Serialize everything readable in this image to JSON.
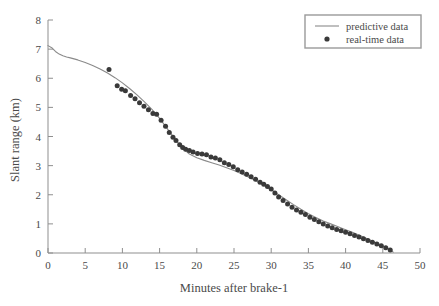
{
  "chart_data": {
    "type": "line",
    "title": "",
    "xlabel": "Minutes after brake-1",
    "ylabel": "Slant range (km)",
    "xlim": [
      0,
      50
    ],
    "ylim": [
      0,
      8
    ],
    "xticks": [
      0,
      5,
      10,
      15,
      20,
      25,
      30,
      35,
      40,
      45,
      50
    ],
    "yticks": [
      0,
      1,
      2,
      3,
      4,
      5,
      6,
      7,
      8
    ],
    "grid": false,
    "legend_position": "top-right",
    "legend": [
      {
        "label": "predictive data",
        "marker": "line",
        "color": "#8a8a8a"
      },
      {
        "label": "real-time data",
        "marker": "dot",
        "color": "#3a3a3a"
      }
    ],
    "series": [
      {
        "name": "predictive data",
        "type": "line",
        "color": "#8a8a8a",
        "points": [
          [
            0.0,
            7.12
          ],
          [
            0.5,
            7.05
          ],
          [
            1.0,
            6.92
          ],
          [
            1.5,
            6.83
          ],
          [
            2.0,
            6.77
          ],
          [
            2.5,
            6.73
          ],
          [
            3.0,
            6.7
          ],
          [
            4.0,
            6.63
          ],
          [
            5.0,
            6.54
          ],
          [
            6.0,
            6.44
          ],
          [
            7.0,
            6.32
          ],
          [
            8.0,
            6.18
          ],
          [
            9.0,
            6.02
          ],
          [
            10.0,
            5.84
          ],
          [
            11.0,
            5.64
          ],
          [
            12.0,
            5.42
          ],
          [
            13.0,
            5.18
          ],
          [
            14.0,
            4.92
          ],
          [
            15.0,
            4.62
          ],
          [
            16.0,
            4.28
          ],
          [
            17.0,
            3.94
          ],
          [
            18.0,
            3.62
          ],
          [
            19.0,
            3.4
          ],
          [
            20.0,
            3.27
          ],
          [
            21.0,
            3.18
          ],
          [
            22.0,
            3.1
          ],
          [
            23.0,
            3.02
          ],
          [
            24.0,
            2.93
          ],
          [
            25.0,
            2.83
          ],
          [
            26.0,
            2.72
          ],
          [
            27.0,
            2.6
          ],
          [
            28.0,
            2.47
          ],
          [
            29.0,
            2.33
          ],
          [
            30.0,
            2.17
          ],
          [
            31.0,
            2.0
          ],
          [
            32.0,
            1.83
          ],
          [
            33.0,
            1.66
          ],
          [
            34.0,
            1.5
          ],
          [
            35.0,
            1.35
          ],
          [
            36.0,
            1.22
          ],
          [
            37.0,
            1.1
          ],
          [
            38.0,
            1.0
          ],
          [
            39.0,
            0.9
          ],
          [
            40.0,
            0.8
          ],
          [
            41.0,
            0.7
          ],
          [
            42.0,
            0.59
          ],
          [
            43.0,
            0.48
          ],
          [
            44.0,
            0.36
          ],
          [
            45.0,
            0.24
          ],
          [
            46.0,
            0.11
          ],
          [
            46.4,
            0.03
          ]
        ]
      },
      {
        "name": "real-time data",
        "type": "scatter",
        "color": "#3a3a3a",
        "points": [
          [
            8.2,
            6.3
          ],
          [
            9.3,
            5.74
          ],
          [
            9.9,
            5.62
          ],
          [
            10.4,
            5.57
          ],
          [
            11.1,
            5.41
          ],
          [
            11.7,
            5.3
          ],
          [
            12.3,
            5.16
          ],
          [
            12.9,
            5.04
          ],
          [
            13.5,
            4.92
          ],
          [
            14.1,
            4.79
          ],
          [
            14.6,
            4.76
          ],
          [
            15.2,
            4.56
          ],
          [
            15.8,
            4.35
          ],
          [
            16.3,
            4.14
          ],
          [
            16.8,
            3.97
          ],
          [
            17.2,
            3.86
          ],
          [
            17.7,
            3.72
          ],
          [
            18.1,
            3.62
          ],
          [
            18.5,
            3.56
          ],
          [
            19.0,
            3.52
          ],
          [
            19.5,
            3.47
          ],
          [
            20.1,
            3.42
          ],
          [
            20.7,
            3.4
          ],
          [
            21.3,
            3.37
          ],
          [
            21.9,
            3.3
          ],
          [
            22.5,
            3.26
          ],
          [
            23.1,
            3.2
          ],
          [
            23.7,
            3.1
          ],
          [
            24.3,
            3.04
          ],
          [
            24.9,
            2.96
          ],
          [
            25.5,
            2.86
          ],
          [
            26.1,
            2.78
          ],
          [
            26.7,
            2.7
          ],
          [
            27.3,
            2.62
          ],
          [
            27.9,
            2.53
          ],
          [
            28.5,
            2.43
          ],
          [
            29.0,
            2.36
          ],
          [
            29.5,
            2.28
          ],
          [
            30.0,
            2.2
          ],
          [
            30.5,
            2.06
          ],
          [
            31.0,
            1.92
          ],
          [
            31.6,
            1.8
          ],
          [
            32.2,
            1.68
          ],
          [
            32.8,
            1.57
          ],
          [
            33.4,
            1.48
          ],
          [
            34.0,
            1.4
          ],
          [
            34.6,
            1.32
          ],
          [
            35.2,
            1.23
          ],
          [
            35.8,
            1.15
          ],
          [
            36.4,
            1.07
          ],
          [
            37.0,
            1.0
          ],
          [
            37.6,
            0.93
          ],
          [
            38.2,
            0.87
          ],
          [
            38.8,
            0.81
          ],
          [
            39.4,
            0.76
          ],
          [
            40.0,
            0.71
          ],
          [
            40.6,
            0.66
          ],
          [
            41.2,
            0.6
          ],
          [
            41.8,
            0.55
          ],
          [
            42.4,
            0.49
          ],
          [
            43.0,
            0.43
          ],
          [
            43.6,
            0.37
          ],
          [
            44.2,
            0.31
          ],
          [
            44.8,
            0.25
          ],
          [
            45.4,
            0.18
          ],
          [
            46.0,
            0.1
          ]
        ]
      }
    ]
  },
  "axes": {
    "x_tick_labels": [
      "0",
      "5",
      "10",
      "15",
      "20",
      "25",
      "30",
      "35",
      "40",
      "45",
      "50"
    ],
    "y_tick_labels": [
      "0",
      "1",
      "2",
      "3",
      "4",
      "5",
      "6",
      "7",
      "8"
    ],
    "x_title": "Minutes after brake-1",
    "y_title": "Slant range (km)"
  },
  "legend": {
    "entries": [
      {
        "label": "predictive data"
      },
      {
        "label": "real-time data"
      }
    ]
  },
  "colors": {
    "line": "#8a8a8a",
    "marker": "#3a3a3a",
    "axis": "#8f8f8f",
    "text": "#4a4a4a",
    "legend_border": "#9a9a9a",
    "background": "#ffffff"
  }
}
